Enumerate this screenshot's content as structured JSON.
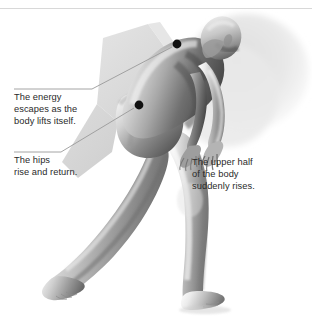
{
  "figure": {
    "pose": "forward-leaning stride, head tucked, arms swinging, rear leg extended",
    "background_color": "#ffffff",
    "top_rule_color": "#d8d8d8",
    "wedge_color": "#d9d9d9",
    "wedge_color_light": "#e6e6e6",
    "halo_color": "#e9e9e9",
    "marker_color": "#111111",
    "leader_line_color": "#9a9a9a",
    "text_color": "#2a2a2a"
  },
  "callouts": [
    {
      "id": "energy",
      "text": "The energy\nescapes as the\nbody lifts itself.",
      "marker": {
        "x": 177,
        "y": 44,
        "r": 4.4
      },
      "leader": {
        "x1": 14,
        "y1": 89,
        "x2": 92,
        "y2": 89,
        "x3": 172,
        "y3": 47
      }
    },
    {
      "id": "hips",
      "text": "The hips\nrise and return.",
      "marker": {
        "x": 139,
        "y": 105,
        "r": 4.4
      },
      "leader": {
        "x1": 14,
        "y1": 152,
        "x2": 61,
        "y2": 152,
        "x3": 134,
        "y3": 108
      }
    },
    {
      "id": "upper",
      "text": "The upper half\nof the body\nsuddenly rises.",
      "marker": null,
      "leader": null
    }
  ]
}
